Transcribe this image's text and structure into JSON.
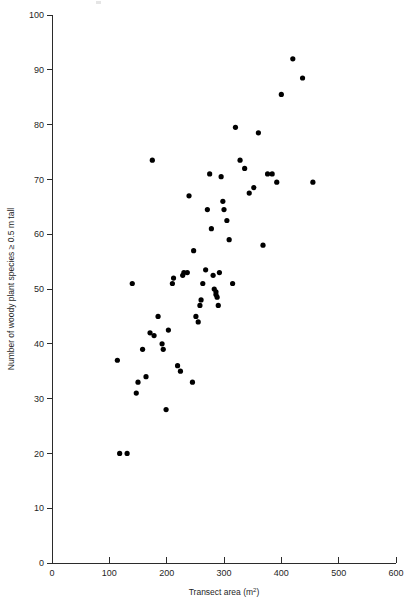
{
  "figure": {
    "background_color": "#ffffff",
    "point_color": "#000000",
    "axis_color": "#2b2b2b"
  },
  "chart_data": {
    "type": "scatter",
    "title": "",
    "subtitle": "",
    "xlabel": "Transect area (m2)",
    "xlabel_base": "Transect area (m",
    "xlabel_sup": "2",
    "xlabel_close": ")",
    "ylabel": "Number of woody plant species ≥ 0.5 m tall",
    "xlim": [
      0,
      600
    ],
    "ylim": [
      0,
      100
    ],
    "xticks": [
      0,
      100,
      200,
      300,
      400,
      500,
      600
    ],
    "xticklabels": [
      "0",
      "100",
      "200",
      "300",
      "400",
      "500",
      "600"
    ],
    "yticks": [
      0,
      10,
      20,
      30,
      40,
      50,
      60,
      70,
      80,
      90,
      100
    ],
    "yticklabels": [
      "0",
      "10",
      "20",
      "30",
      "40",
      "50",
      "60",
      "70",
      "80",
      "90",
      "100"
    ],
    "grid": false,
    "legend": false,
    "marker": "filled-circle",
    "marker_size": 2.6,
    "n_points": 62,
    "x": [
      118,
      131,
      114,
      147,
      150,
      158,
      140,
      164,
      171,
      178,
      185,
      175,
      192,
      194,
      199,
      203,
      210,
      212,
      219,
      224,
      228,
      230,
      236,
      239,
      245,
      247,
      251,
      255,
      258,
      260,
      263,
      268,
      271,
      275,
      278,
      281,
      283,
      286,
      286,
      288,
      290,
      292,
      295,
      298,
      300,
      305,
      309,
      315,
      320,
      328,
      336,
      344,
      352,
      360,
      368,
      376,
      384,
      392,
      400,
      420,
      437,
      455
    ],
    "y": [
      20,
      20,
      37,
      31,
      33,
      39,
      51,
      34,
      42,
      41.5,
      45,
      73.5,
      40,
      39,
      28,
      42.5,
      51,
      52,
      36,
      35,
      52.5,
      53,
      53,
      67,
      33,
      57,
      45,
      44,
      47,
      48,
      51,
      53.5,
      64.5,
      71,
      61,
      52.5,
      50,
      49.5,
      49,
      48.5,
      47,
      53,
      70.5,
      66,
      64.5,
      62.5,
      59,
      51,
      79.5,
      73.5,
      72,
      67.5,
      68.5,
      78.5,
      58,
      71,
      71,
      69.5,
      85.5,
      92,
      88.5,
      69.5
    ],
    "points": [
      {
        "x": 118,
        "y": 20
      },
      {
        "x": 131,
        "y": 20
      },
      {
        "x": 114,
        "y": 37
      },
      {
        "x": 147,
        "y": 31
      },
      {
        "x": 150,
        "y": 33
      },
      {
        "x": 158,
        "y": 39
      },
      {
        "x": 140,
        "y": 51
      },
      {
        "x": 164,
        "y": 34
      },
      {
        "x": 171,
        "y": 42
      },
      {
        "x": 178,
        "y": 41.5
      },
      {
        "x": 185,
        "y": 45
      },
      {
        "x": 175,
        "y": 73.5
      },
      {
        "x": 192,
        "y": 40
      },
      {
        "x": 194,
        "y": 39
      },
      {
        "x": 199,
        "y": 28
      },
      {
        "x": 203,
        "y": 42.5
      },
      {
        "x": 210,
        "y": 51
      },
      {
        "x": 212,
        "y": 52
      },
      {
        "x": 219,
        "y": 36
      },
      {
        "x": 224,
        "y": 35
      },
      {
        "x": 228,
        "y": 52.5
      },
      {
        "x": 230,
        "y": 53
      },
      {
        "x": 236,
        "y": 53
      },
      {
        "x": 239,
        "y": 67
      },
      {
        "x": 245,
        "y": 33
      },
      {
        "x": 247,
        "y": 57
      },
      {
        "x": 251,
        "y": 45
      },
      {
        "x": 255,
        "y": 44
      },
      {
        "x": 258,
        "y": 47
      },
      {
        "x": 260,
        "y": 48
      },
      {
        "x": 263,
        "y": 51
      },
      {
        "x": 268,
        "y": 53.5
      },
      {
        "x": 271,
        "y": 64.5
      },
      {
        "x": 275,
        "y": 71
      },
      {
        "x": 278,
        "y": 61
      },
      {
        "x": 281,
        "y": 52.5
      },
      {
        "x": 283,
        "y": 50
      },
      {
        "x": 286,
        "y": 49.5
      },
      {
        "x": 286,
        "y": 49
      },
      {
        "x": 288,
        "y": 48.5
      },
      {
        "x": 290,
        "y": 47
      },
      {
        "x": 292,
        "y": 53
      },
      {
        "x": 295,
        "y": 70.5
      },
      {
        "x": 298,
        "y": 66
      },
      {
        "x": 300,
        "y": 64.5
      },
      {
        "x": 305,
        "y": 62.5
      },
      {
        "x": 309,
        "y": 59
      },
      {
        "x": 315,
        "y": 51
      },
      {
        "x": 320,
        "y": 79.5
      },
      {
        "x": 328,
        "y": 73.5
      },
      {
        "x": 336,
        "y": 72
      },
      {
        "x": 344,
        "y": 67.5
      },
      {
        "x": 352,
        "y": 68.5
      },
      {
        "x": 360,
        "y": 78.5
      },
      {
        "x": 368,
        "y": 58
      },
      {
        "x": 376,
        "y": 71
      },
      {
        "x": 384,
        "y": 71
      },
      {
        "x": 392,
        "y": 69.5
      },
      {
        "x": 400,
        "y": 85.5
      },
      {
        "x": 420,
        "y": 92
      },
      {
        "x": 437,
        "y": 88.5
      },
      {
        "x": 455,
        "y": 69.5
      }
    ]
  }
}
